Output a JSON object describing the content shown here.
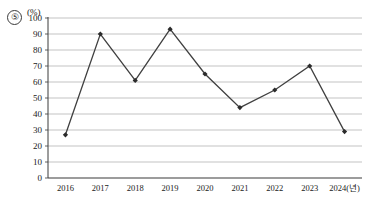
{
  "question_marker": "⑤",
  "axis": {
    "unit_label": "(%)",
    "y_ticks": [
      "100",
      "90",
      "80",
      "70",
      "60",
      "50",
      "40",
      "30",
      "20",
      "10",
      "0"
    ],
    "x_ticks": [
      "2016",
      "2017",
      "2018",
      "2019",
      "2020",
      "2021",
      "2022",
      "2023",
      "2024(년)"
    ]
  },
  "style": {
    "line_color": "#404040",
    "marker_color": "#2b2b2b",
    "grid_color": "#b4b4b4",
    "axis_color": "#3a3a3a",
    "background": "#ffffff"
  },
  "chart_data": {
    "type": "line",
    "title": "",
    "subtitle": "",
    "xlabel": "2024(년)",
    "ylabel": "(%)",
    "categories": [
      "2016",
      "2017",
      "2018",
      "2019",
      "2020",
      "2021",
      "2022",
      "2023",
      "2024"
    ],
    "values": [
      27,
      90,
      61,
      93,
      65,
      44,
      55,
      70,
      29
    ],
    "ylim": [
      0,
      100
    ],
    "ytick_step": 10,
    "grid": "horizontal",
    "legend": "none",
    "markers": "diamond",
    "series": [
      {
        "name": "",
        "values": [
          27,
          90,
          61,
          93,
          65,
          44,
          55,
          70,
          29
        ]
      }
    ]
  }
}
